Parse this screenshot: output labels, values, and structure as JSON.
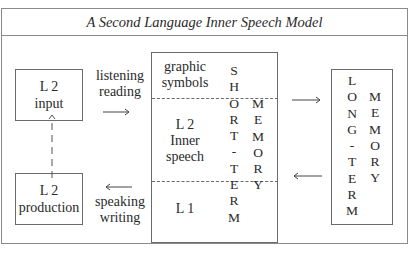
{
  "title": "A Second Language Inner Speech Model",
  "left_column": {
    "input_box": {
      "line1": "L 2",
      "line2": "input"
    },
    "production_box": {
      "line1": "L 2",
      "line2": "production"
    },
    "feedback_arrow": "dashed-up-arrow"
  },
  "input_channel": {
    "line1": "listening",
    "line2": "reading",
    "arrow": "right-arrow"
  },
  "output_channel": {
    "line1": "speaking",
    "line2": "writing",
    "arrow": "left-arrow"
  },
  "short_term_memory": {
    "sections": [
      {
        "line1": "graphic",
        "line2": "symbols"
      },
      {
        "line1": "L 2",
        "line2": "Inner",
        "line3": "speech"
      },
      {
        "line1": "L 1"
      }
    ],
    "vertical_word_1": [
      "S",
      "H",
      "O",
      "R",
      "T",
      "-",
      "T",
      "E",
      "R",
      "M"
    ],
    "vertical_word_2": [
      "M",
      "E",
      "M",
      "O",
      "R",
      "Y"
    ]
  },
  "to_long_term_arrow": "right-arrow",
  "from_long_term_arrow": "left-arrow",
  "long_term_memory": {
    "vertical_word_1": [
      "L",
      "O",
      "N",
      "G",
      "-",
      "T",
      "E",
      "R",
      "M"
    ],
    "vertical_word_2": [
      "M",
      "E",
      "M",
      "O",
      "R",
      "Y"
    ]
  }
}
